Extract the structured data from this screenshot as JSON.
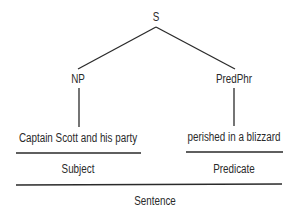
{
  "tree": {
    "root": "S",
    "left_node": "NP",
    "right_node": "PredPhr",
    "left_phrase": "Captain Scott and his party",
    "right_phrase": "perished in a blizzard",
    "left_function": "Subject",
    "right_function": "Predicate",
    "whole": "Sentence"
  }
}
